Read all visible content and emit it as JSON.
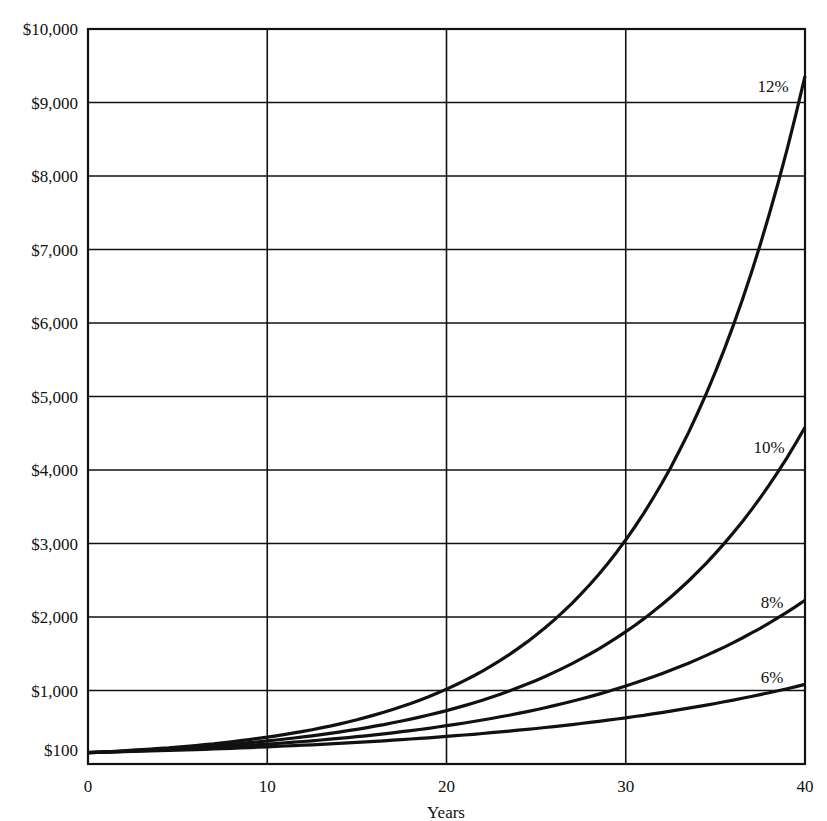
{
  "chart_data": {
    "type": "line",
    "title": "",
    "xlabel": "Years",
    "ylabel": "",
    "x": [
      0,
      5,
      10,
      15,
      20,
      25,
      30,
      35,
      40
    ],
    "xlim": [
      0,
      40
    ],
    "ylim": [
      0,
      10000
    ],
    "x_ticks": [
      "0",
      "10",
      "20",
      "30",
      "40"
    ],
    "y_ticks": [
      "$100",
      "$1,000",
      "$2,000",
      "$3,000",
      "$4,000",
      "$5,000",
      "$6,000",
      "$7,000",
      "$8,000",
      "$9,000",
      "$10,000"
    ],
    "grid": true,
    "legend_position": "inline-right",
    "series": [
      {
        "name": "6%",
        "rate": 0.06,
        "values": [
          100,
          134,
          179,
          240,
          321,
          429,
          574,
          769,
          1029
        ]
      },
      {
        "name": "8%",
        "rate": 0.08,
        "values": [
          100,
          147,
          216,
          317,
          466,
          685,
          1006,
          1479,
          2172
        ]
      },
      {
        "name": "10%",
        "rate": 0.1,
        "values": [
          100,
          161,
          259,
          418,
          673,
          1083,
          1745,
          2810,
          4526
        ]
      },
      {
        "name": "12%",
        "rate": 0.12,
        "values": [
          100,
          176,
          311,
          547,
          965,
          1700,
          2996,
          5280,
          9305
        ]
      }
    ]
  }
}
